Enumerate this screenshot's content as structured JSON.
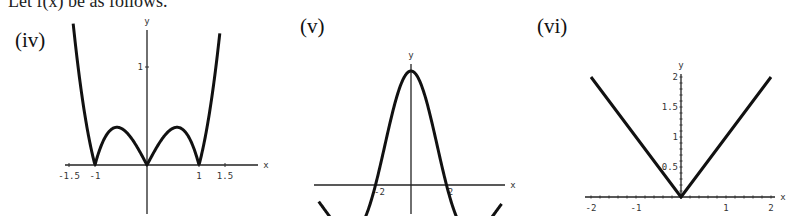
{
  "page": {
    "top_text": "Let f(x) be as follows."
  },
  "chart_data": [
    {
      "id": "iv",
      "panel_label": "(iv)",
      "type": "line",
      "function_shape": "|x^3 - x|",
      "xlabel": "x",
      "ylabel": "y",
      "x_ticks": [
        "-1.5",
        "-1",
        "1",
        "1.5"
      ],
      "y_ticks": [
        "1"
      ],
      "xlim": [
        -2,
        2
      ],
      "ylim": [
        -0.5,
        1.4
      ],
      "x_range_drawn": [
        -1.42,
        1.4
      ],
      "key_points": [
        {
          "x": -1.42,
          "y": 1.44
        },
        {
          "x": -1,
          "y": 0
        },
        {
          "x": -0.577,
          "y": 0.385
        },
        {
          "x": 0,
          "y": 0
        },
        {
          "x": 0.577,
          "y": 0.385
        },
        {
          "x": 1,
          "y": 0
        },
        {
          "x": 1.4,
          "y": 1.34
        }
      ],
      "frame": {
        "ox": 147,
        "oy": 165,
        "sx": 52,
        "sy": 98,
        "axis_left": 65,
        "axis_right": 258,
        "axis_top": 30,
        "axis_bottom": 214
      }
    },
    {
      "id": "v",
      "panel_label": "(v)",
      "type": "line",
      "function_shape": "damped cosine (sinc-like), peak at x=0",
      "xlabel": "x",
      "ylabel": "y",
      "x_ticks": [
        "-2",
        "2"
      ],
      "y_ticks": [],
      "key_points": [
        {
          "x": -3.6,
          "y": 0.11
        },
        {
          "x": -2.8,
          "y": -0.21
        },
        {
          "x": -2,
          "y": 0
        },
        {
          "x": 0,
          "y": 1
        },
        {
          "x": 2,
          "y": 0
        },
        {
          "x": 2.8,
          "y": -0.21
        },
        {
          "x": 3.6,
          "y": 0.11
        }
      ],
      "frame": {
        "ox": 411,
        "oy": 185,
        "sx": 17.75,
        "sy": 114,
        "axis_left": 314,
        "axis_right": 505,
        "axis_top": 64,
        "axis_bottom": 214
      }
    },
    {
      "id": "vi",
      "panel_label": "(vi)",
      "type": "line",
      "function_shape": "|x|",
      "xlabel": "x",
      "ylabel": "y",
      "x_ticks": [
        "-2",
        "-1",
        "1",
        "2"
      ],
      "y_ticks": [
        "0.5",
        "1",
        "1.5",
        "2"
      ],
      "xlim": [
        -2,
        2
      ],
      "ylim": [
        0,
        2
      ],
      "key_points": [
        {
          "x": -2,
          "y": 2
        },
        {
          "x": 0,
          "y": 0
        },
        {
          "x": 2,
          "y": 2
        }
      ],
      "frame": {
        "ox": 681,
        "oy": 197,
        "sx": 45,
        "sy": 60,
        "axis_left": 585,
        "axis_right": 775,
        "axis_top": 74,
        "axis_bottom": 199
      }
    }
  ]
}
